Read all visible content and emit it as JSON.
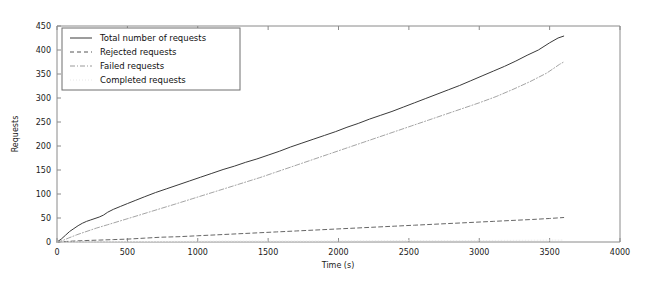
{
  "chart_data": {
    "type": "line",
    "title": "",
    "xlabel": "Time (s)",
    "ylabel": "Requests",
    "xlim": [
      0,
      4000
    ],
    "ylim": [
      0,
      450
    ],
    "xticks": [
      0,
      500,
      1000,
      1500,
      2000,
      2500,
      3000,
      3500,
      4000
    ],
    "xtick_labels": [
      "0",
      "500",
      "1000",
      "1500",
      "2000",
      "2500",
      "3000",
      "3500",
      "4000"
    ],
    "yticks": [
      0,
      50,
      100,
      150,
      200,
      250,
      300,
      350,
      400,
      450
    ],
    "ytick_labels": [
      "0",
      "50",
      "100",
      "150",
      "200",
      "250",
      "300",
      "350",
      "400",
      "450"
    ],
    "grid": false,
    "legend_position": "upper left",
    "series": [
      {
        "name": "Total number of requests",
        "style": "solid",
        "color": "#3a3a3a",
        "x": [
          0,
          30,
          60,
          90,
          120,
          150,
          180,
          210,
          240,
          270,
          300,
          330,
          360,
          400,
          450,
          500,
          560,
          620,
          700,
          780,
          860,
          940,
          1020,
          1100,
          1180,
          1260,
          1340,
          1420,
          1500,
          1580,
          1660,
          1740,
          1820,
          1900,
          1980,
          2060,
          2140,
          2220,
          2300,
          2380,
          2460,
          2540,
          2620,
          2700,
          2780,
          2860,
          2940,
          3020,
          3100,
          3180,
          3260,
          3340,
          3420,
          3500,
          3560,
          3600
        ],
        "y": [
          0,
          6,
          14,
          22,
          28,
          34,
          39,
          43,
          46,
          49,
          52,
          56,
          62,
          68,
          74,
          80,
          87,
          94,
          103,
          111,
          119,
          127,
          135,
          143,
          151,
          158,
          166,
          173,
          181,
          189,
          198,
          206,
          214,
          222,
          230,
          239,
          247,
          256,
          264,
          272,
          281,
          290,
          299,
          308,
          317,
          326,
          336,
          346,
          356,
          366,
          377,
          389,
          400,
          415,
          425,
          429
        ]
      },
      {
        "name": "Rejected requests",
        "style": "dashed",
        "color": "#555555",
        "x": [
          0,
          60,
          120,
          200,
          300,
          400,
          500,
          620,
          740,
          860,
          1000,
          1140,
          1280,
          1420,
          1560,
          1700,
          1840,
          1980,
          2120,
          2260,
          2400,
          2540,
          2680,
          2820,
          2960,
          3100,
          3240,
          3380,
          3500,
          3600
        ],
        "y": [
          0,
          1,
          2,
          3,
          4,
          5,
          6,
          8,
          10,
          11,
          13,
          15,
          17,
          19,
          21,
          23,
          25,
          27,
          29,
          31,
          33,
          35,
          37,
          39,
          41,
          43,
          45,
          47,
          49,
          51
        ]
      },
      {
        "name": "Failed requests",
        "style": "dashdot",
        "color": "#9a9a9a",
        "x": [
          0,
          40,
          80,
          140,
          200,
          280,
          360,
          450,
          540,
          640,
          740,
          840,
          960,
          1080,
          1200,
          1320,
          1440,
          1560,
          1680,
          1800,
          1920,
          2040,
          2160,
          2280,
          2400,
          2520,
          2640,
          2760,
          2880,
          3000,
          3120,
          3240,
          3360,
          3480,
          3570,
          3600
        ],
        "y": [
          0,
          3,
          8,
          15,
          21,
          29,
          36,
          44,
          52,
          61,
          70,
          79,
          90,
          101,
          112,
          123,
          134,
          146,
          158,
          170,
          182,
          194,
          206,
          218,
          230,
          242,
          254,
          266,
          278,
          290,
          303,
          318,
          334,
          352,
          370,
          375
        ]
      },
      {
        "name": "Completed requests",
        "style": "dotted",
        "color": "#e8e8e8",
        "x": [
          0,
          600,
          1200,
          1800,
          2400,
          3000,
          3600
        ],
        "y": [
          0,
          1,
          2,
          2,
          3,
          3,
          4
        ]
      }
    ]
  },
  "legend": {
    "entries": [
      {
        "label": "Total number of requests"
      },
      {
        "label": "Rejected requests"
      },
      {
        "label": "Failed requests"
      },
      {
        "label": "Completed requests"
      }
    ]
  }
}
